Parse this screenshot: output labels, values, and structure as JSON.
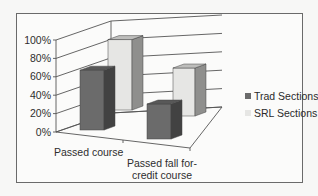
{
  "chart_data": {
    "type": "bar",
    "subtype": "3d-clustered-column",
    "title": "",
    "xlabel": "",
    "ylabel": "",
    "categories": [
      "Passed course",
      "Passed fall for-credit course"
    ],
    "series": [
      {
        "name": "Trad Sections",
        "values": [
          65,
          38
        ],
        "color": "#6b6b6b"
      },
      {
        "name": "SRL Sections",
        "values": [
          88,
          60
        ],
        "color": "#e6e6e4"
      }
    ],
    "ylim": [
      0,
      100
    ],
    "yticks": [
      "0%",
      "20%",
      "40%",
      "60%",
      "80%",
      "100%"
    ],
    "grid": true,
    "legend_position": "right"
  },
  "axis": {
    "ticks": [
      "0%",
      "20%",
      "40%",
      "60%",
      "80%",
      "100%"
    ],
    "category_labels": [
      {
        "lines": [
          "Passed course"
        ]
      },
      {
        "lines": [
          "Passed fall for-",
          "credit course"
        ]
      }
    ]
  },
  "legend": {
    "items": [
      {
        "label": "Trad Sections",
        "color": "#6b6b6b"
      },
      {
        "label": "SRL Sections",
        "color": "#e6e6e4"
      }
    ]
  }
}
